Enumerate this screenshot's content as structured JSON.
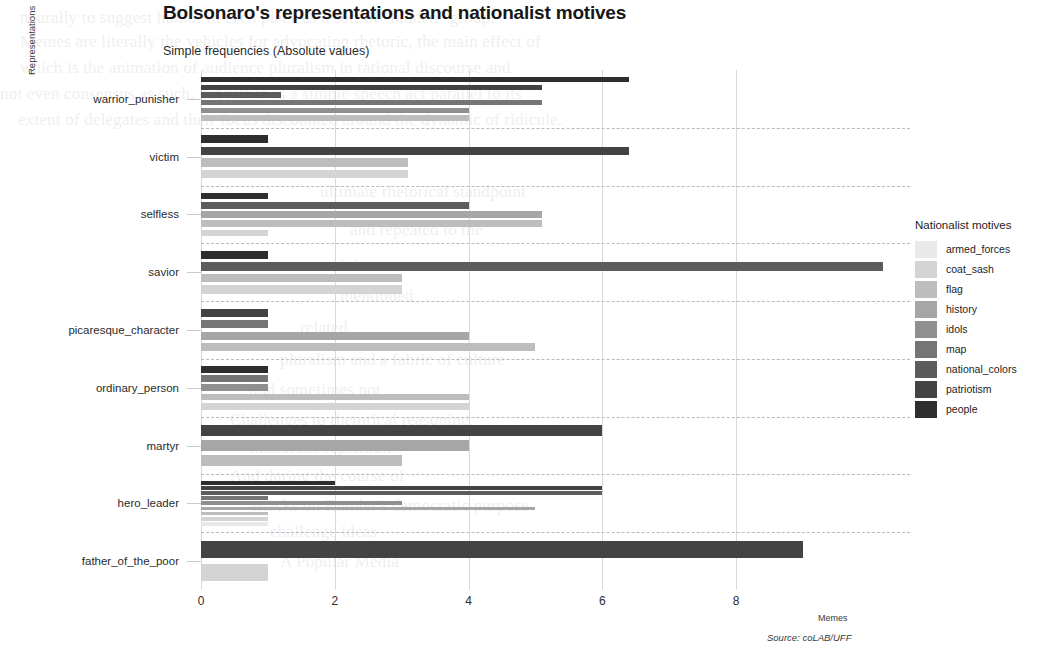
{
  "chart_data": {
    "type": "bar",
    "orientation": "horizontal",
    "grouped": true,
    "title": "Bolsonaro's representations and nationalist motives",
    "subtitle": "Simple frequencies (Absolute values)",
    "caption": "Source: coLAB/UFF",
    "xlabel": "Memes",
    "ylabel": "Representations",
    "xlim": [
      0,
      10.6
    ],
    "xticks": [
      0,
      2,
      4,
      6,
      8
    ],
    "grid": true,
    "legend_title": "Nationalist motives",
    "legend_position": "right",
    "series": [
      {
        "name": "armed_forces",
        "color": "#e9e9e9"
      },
      {
        "name": "coat_sash",
        "color": "#d4d4d4"
      },
      {
        "name": "flag",
        "color": "#bdbdbd"
      },
      {
        "name": "history",
        "color": "#a6a6a6"
      },
      {
        "name": "idols",
        "color": "#8f8f8f"
      },
      {
        "name": "map",
        "color": "#757575"
      },
      {
        "name": "national_colors",
        "color": "#5c5c5c"
      },
      {
        "name": "patriotism",
        "color": "#434343"
      },
      {
        "name": "people",
        "color": "#2e2e2e"
      }
    ],
    "categories": [
      "warrior_punisher",
      "victim",
      "selfless",
      "savior",
      "picaresque_character",
      "ordinary_person",
      "martyr",
      "hero_leader",
      "father_of_the_poor"
    ],
    "groups": [
      {
        "category": "warrior_punisher",
        "bars": [
          {
            "series": "people",
            "value": 6.4
          },
          {
            "series": "patriotism",
            "value": 5.1
          },
          {
            "series": "national_colors",
            "value": 1.2
          },
          {
            "series": "map",
            "value": 5.1
          },
          {
            "series": "idols",
            "value": 4.0
          },
          {
            "series": "flag",
            "value": 4.0
          }
        ]
      },
      {
        "category": "victim",
        "bars": [
          {
            "series": "people",
            "value": 1.0
          },
          {
            "series": "patriotism",
            "value": 6.4
          },
          {
            "series": "flag",
            "value": 3.1
          },
          {
            "series": "coat_sash",
            "value": 3.1
          }
        ]
      },
      {
        "category": "selfless",
        "bars": [
          {
            "series": "people",
            "value": 1.0
          },
          {
            "series": "national_colors",
            "value": 4.0
          },
          {
            "series": "history",
            "value": 5.1
          },
          {
            "series": "flag",
            "value": 5.1
          },
          {
            "series": "coat_sash",
            "value": 1.0
          }
        ]
      },
      {
        "category": "savior",
        "bars": [
          {
            "series": "people",
            "value": 1.0
          },
          {
            "series": "national_colors",
            "value": 10.2
          },
          {
            "series": "flag",
            "value": 3.0
          },
          {
            "series": "coat_sash",
            "value": 3.0
          }
        ]
      },
      {
        "category": "picaresque_character",
        "bars": [
          {
            "series": "patriotism",
            "value": 1.0
          },
          {
            "series": "map",
            "value": 1.0
          },
          {
            "series": "history",
            "value": 4.0
          },
          {
            "series": "flag",
            "value": 5.0
          }
        ]
      },
      {
        "category": "ordinary_person",
        "bars": [
          {
            "series": "people",
            "value": 1.0
          },
          {
            "series": "map",
            "value": 1.0
          },
          {
            "series": "idols",
            "value": 1.0
          },
          {
            "series": "flag",
            "value": 4.0
          },
          {
            "series": "coat_sash",
            "value": 4.0
          }
        ]
      },
      {
        "category": "martyr",
        "bars": [
          {
            "series": "patriotism",
            "value": 6.0
          },
          {
            "series": "history",
            "value": 4.0
          },
          {
            "series": "flag",
            "value": 3.0
          }
        ]
      },
      {
        "category": "hero_leader",
        "bars": [
          {
            "series": "people",
            "value": 2.0
          },
          {
            "series": "patriotism",
            "value": 6.0
          },
          {
            "series": "national_colors",
            "value": 6.0
          },
          {
            "series": "map",
            "value": 1.0
          },
          {
            "series": "idols",
            "value": 3.0
          },
          {
            "series": "history",
            "value": 5.0
          },
          {
            "series": "flag",
            "value": 1.0
          },
          {
            "series": "coat_sash",
            "value": 1.0
          },
          {
            "series": "armed_forces",
            "value": 1.0
          }
        ]
      },
      {
        "category": "father_of_the_poor",
        "bars": [
          {
            "series": "patriotism",
            "value": 9.0
          },
          {
            "series": "coat_sash",
            "value": 1.0
          }
        ]
      }
    ]
  },
  "bleed_text": [
    {
      "x": 20,
      "y": 8,
      "t": "neurally to suggest humor in each piece as a sort of \"hidden\" group."
    },
    {
      "x": 20,
      "y": 32,
      "t": "Memes are literally the vehicles for advocating rhetoric, the main effect of"
    },
    {
      "x": 20,
      "y": 58,
      "t": "which is the animation of audience pluralism in rational discourse and"
    },
    {
      "x": 0,
      "y": 84,
      "t": "not even consensus as such, but rather as a simple speech act parallel to its"
    },
    {
      "x": 18,
      "y": 110,
      "t": "extent of delegates and their focus discounted around the dynamic of ridicule."
    },
    {
      "x": 320,
      "y": 182,
      "t": "ultimate rhetorical standpoint"
    },
    {
      "x": 350,
      "y": 220,
      "t": "and repeated to the"
    },
    {
      "x": 330,
      "y": 256,
      "t": "of the"
    },
    {
      "x": 340,
      "y": 286,
      "t": "mentioned"
    },
    {
      "x": 300,
      "y": 318,
      "t": "related"
    },
    {
      "x": 280,
      "y": 350,
      "t": "pluralism and a fabric of culture"
    },
    {
      "x": 250,
      "y": 380,
      "t": "and sometimes not"
    },
    {
      "x": 230,
      "y": 410,
      "t": "Challenges to rhetorical reasoning"
    },
    {
      "x": 250,
      "y": 438,
      "t": "humorous repetition"
    },
    {
      "x": 230,
      "y": 466,
      "t": "And during the course of"
    },
    {
      "x": 250,
      "y": 496,
      "t": "attacks on Rumler's democratic purpose"
    },
    {
      "x": 270,
      "y": 522,
      "t": "challenge ideas"
    },
    {
      "x": 280,
      "y": 552,
      "t": "A Popular Media"
    }
  ]
}
